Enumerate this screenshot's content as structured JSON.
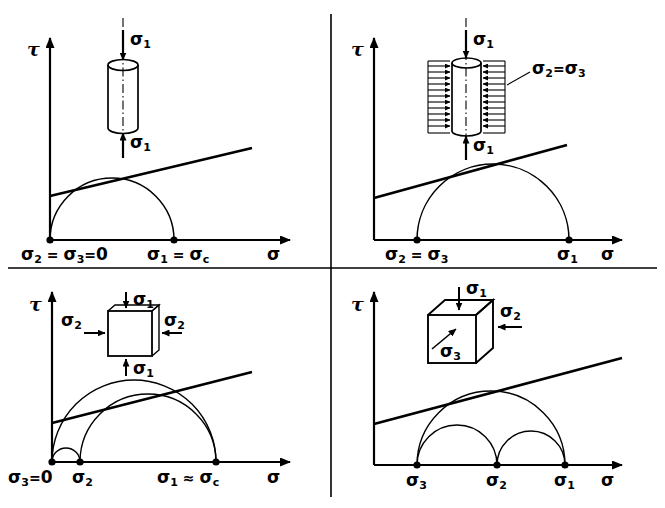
{
  "figure": {
    "type": "mohr-circle-diagram-set",
    "panel_count": 4,
    "axis_labels": {
      "shear": "τ",
      "normal": "σ"
    },
    "sigma_glyph": "σ"
  },
  "panels": [
    {
      "id": "uniaxial-compression",
      "position": "top-left",
      "specimen": "cylinder",
      "specimen_labels": [
        {
          "name": "sigma1-top",
          "base": "σ",
          "sub": "1"
        },
        {
          "name": "sigma1-bottom",
          "base": "σ",
          "sub": "1"
        }
      ],
      "axis": {
        "y": "τ",
        "x": "σ"
      },
      "tick_labels": [
        {
          "name": "origin-tick",
          "parts": [
            {
              "base": "σ",
              "sub": "2"
            },
            {
              "op": " = "
            },
            {
              "base": "σ",
              "sub": "3"
            },
            {
              "op": "= "
            },
            {
              "base": "0",
              "sub": ""
            }
          ],
          "text": "σ2 = σ3= 0"
        },
        {
          "name": "sigma1-tick",
          "parts": [
            {
              "base": "σ",
              "sub": "1"
            },
            {
              "op": " = "
            },
            {
              "base": "σ",
              "sub": "c"
            }
          ],
          "text": "σ1 = σc"
        }
      ],
      "circles": [
        {
          "name": "mohr-circle-main",
          "start": 0,
          "end": 1
        }
      ],
      "envelope": {
        "name": "failure-envelope",
        "tangent": true
      }
    },
    {
      "id": "triaxial-confined",
      "position": "top-right",
      "specimen": "confined-cylinder",
      "specimen_labels": [
        {
          "name": "sigma1-top",
          "base": "σ",
          "sub": "1"
        },
        {
          "name": "sigma1-bottom",
          "base": "σ",
          "sub": "1"
        },
        {
          "name": "confining-pressure",
          "text": "σ2 = σ3"
        }
      ],
      "axis": {
        "y": "τ",
        "x": "σ"
      },
      "tick_labels": [
        {
          "name": "sigma23-tick",
          "text": "σ2 = σ3"
        },
        {
          "name": "sigma1-tick",
          "text": "σ1"
        }
      ],
      "circles": [
        {
          "name": "mohr-circle-main",
          "start": 1,
          "end": 4
        }
      ],
      "envelope": {
        "name": "failure-envelope",
        "tangent": true
      }
    },
    {
      "id": "biaxial",
      "position": "bottom-left",
      "specimen": "square-plate",
      "specimen_labels": [
        {
          "name": "sigma1-top",
          "base": "σ",
          "sub": "1"
        },
        {
          "name": "sigma1-bottom",
          "base": "σ",
          "sub": "1"
        },
        {
          "name": "sigma2-left",
          "base": "σ",
          "sub": "2"
        },
        {
          "name": "sigma2-right",
          "base": "σ",
          "sub": "2"
        }
      ],
      "axis": {
        "y": "τ",
        "x": "σ"
      },
      "tick_labels": [
        {
          "name": "sigma3-tick",
          "text": "σ3 = 0"
        },
        {
          "name": "sigma2-tick",
          "text": "σ2"
        },
        {
          "name": "sigma1-tick",
          "text": "σ1 ≈ σc"
        }
      ],
      "circles": [
        {
          "name": "mohr-circle-13",
          "start": 0,
          "end": 1
        },
        {
          "name": "mohr-circle-32",
          "start": 0,
          "end": 0.17
        },
        {
          "name": "mohr-circle-21",
          "start": 0.17,
          "end": 1
        }
      ],
      "envelope": {
        "name": "failure-envelope",
        "tangent": true
      }
    },
    {
      "id": "general-triaxial",
      "position": "bottom-right",
      "specimen": "cube",
      "specimen_labels": [
        {
          "name": "sigma1-top",
          "base": "σ",
          "sub": "1"
        },
        {
          "name": "sigma2-right",
          "base": "σ",
          "sub": "2"
        },
        {
          "name": "sigma3-front",
          "base": "σ",
          "sub": "3"
        }
      ],
      "axis": {
        "y": "τ",
        "x": "σ"
      },
      "tick_labels": [
        {
          "name": "sigma3-tick",
          "text": "σ3"
        },
        {
          "name": "sigma2-tick",
          "text": "σ2"
        },
        {
          "name": "sigma1-tick",
          "text": "σ1"
        }
      ],
      "circles": [
        {
          "name": "mohr-circle-31",
          "start": 0,
          "end": 1
        },
        {
          "name": "mohr-circle-32",
          "start": 0,
          "end": 0.55
        },
        {
          "name": "mohr-circle-21",
          "start": 0.55,
          "end": 1
        }
      ],
      "envelope": {
        "name": "failure-envelope",
        "tangent": true
      }
    }
  ],
  "colors": {
    "ink": "#000000",
    "paper": "#ffffff"
  }
}
